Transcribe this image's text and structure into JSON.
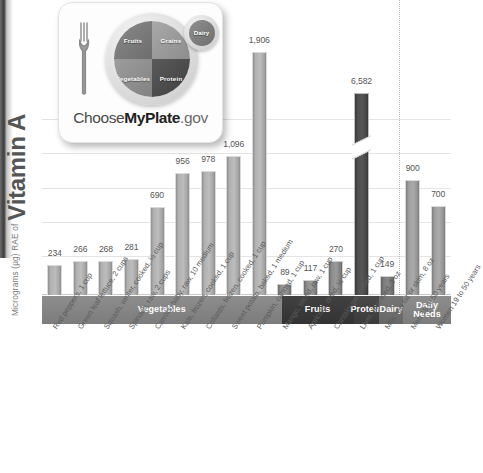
{
  "axis": {
    "y_title_prefix": "Micrograms (µg) RAE of",
    "y_title_main": "Vitamin A"
  },
  "logo": {
    "name": "myplate-logo",
    "wordmark_choose": "Choose",
    "wordmark_myplate": "MyPlate",
    "wordmark_gov": ".gov",
    "segments": {
      "fruits": "Fruits",
      "grains": "Grains",
      "vegetables": "Vegetables",
      "protein": "Protein",
      "dairy": "Dairy"
    }
  },
  "categories": [
    {
      "label": "Vegetables",
      "style": "veg",
      "count": 10
    },
    {
      "label": "Fruits",
      "style": "fruit",
      "count": 3
    },
    {
      "label": "Protein",
      "style": "protein",
      "count": 1
    },
    {
      "label": "Dairy",
      "style": "dairy",
      "count": 1
    },
    {
      "label": "Daily Needs",
      "style": "daily",
      "count": 2
    }
  ],
  "chart_data": {
    "type": "bar",
    "title": "Vitamin A",
    "xlabel": "",
    "ylabel": "Micrograms (µg) RAE of Vitamin A",
    "ylim": [
      0,
      2200
    ],
    "grid": true,
    "legend": false,
    "note": "Protein bar (Liver, pan-fried) is drawn with a broken axis; true value 6,582",
    "categories": [
      "Red peppers, 1 cup",
      "Green leaf lettuce, 2 cups",
      "Squash, winter, cooked, ½ cup",
      "Spinach, raw, 2 cups",
      "Carrots, baby, raw, 10 medium",
      "Kale, frozen, cooked, 1 cup",
      "Collards, frozen, cooked, 1 cup",
      "Sweet potato, baked, 1 medium",
      "Pumpkin, canned, 1 cup",
      "Mango, sliced, raw, 1 cup",
      "Apricots, dried, ½ cup",
      "Cantaloupe, cubed, 1 cup",
      "Liver, pan-fried, 3 oz",
      "Milk, low fat or skim, 8 oz",
      "Men 19 to 50 years",
      "Women 19 to 50 years"
    ],
    "values": [
      234,
      266,
      268,
      281,
      690,
      956,
      978,
      1096,
      1906,
      89,
      117,
      270,
      6582,
      149,
      900,
      700
    ],
    "value_labels": [
      "234",
      "266",
      "268",
      "281",
      "690",
      "956",
      "978",
      "1,096",
      "1,906",
      "89",
      "117",
      "270",
      "6,582",
      "149",
      "900",
      "700"
    ],
    "groups": [
      "veg",
      "veg",
      "veg",
      "veg",
      "veg",
      "veg",
      "veg",
      "veg",
      "veg",
      "fruit",
      "fruit",
      "fruit",
      "protein",
      "dairy",
      "daily",
      "daily"
    ]
  },
  "colors": {
    "vegetables": "#b0b0b0",
    "fruits": "#8c8c8c",
    "protein": "#4f4f4f",
    "dairy": "#7c7c7c",
    "daily_needs": "#9e9e9e",
    "gridline": "#e3e3e3"
  }
}
